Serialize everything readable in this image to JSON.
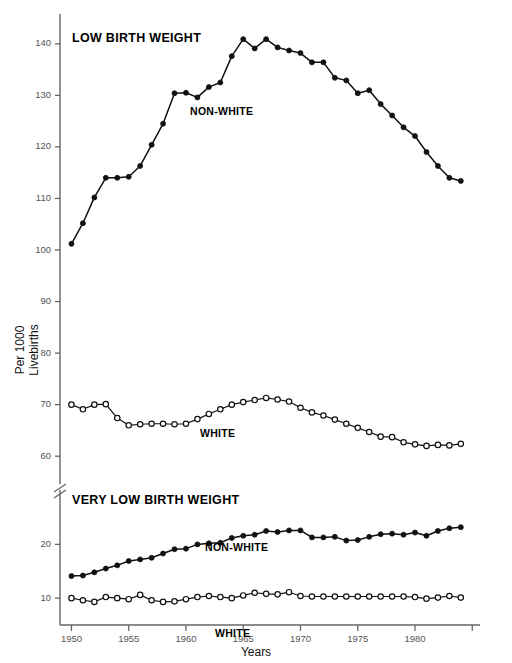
{
  "figure": {
    "background": "#ffffff",
    "line_color": "#111111",
    "axis_color": "#666666"
  },
  "axes": {
    "xlabel": "Years",
    "ylabel_line1": "Per 1000",
    "ylabel_line2": "Livebirths",
    "x_ticks": [
      1950,
      1955,
      1960,
      1965,
      1970,
      1975,
      1980,
      1985
    ],
    "x_tick_labels": [
      "1950",
      "1955",
      "1960",
      "1965",
      "1970",
      "1975",
      "1980",
      ""
    ],
    "xlim": [
      1949,
      1985.5
    ],
    "upper_y_ticks": [
      60,
      70,
      80,
      90,
      100,
      110,
      120,
      130,
      140
    ],
    "upper_ylim": [
      55,
      145
    ],
    "lower_y_ticks": [
      10,
      20
    ],
    "lower_ylim": [
      5,
      29
    ],
    "axis_break": true,
    "grid": false
  },
  "panels": {
    "upper": {
      "title": "LOW BIRTH WEIGHT"
    },
    "lower": {
      "title": "VERY LOW BIRTH WEIGHT"
    }
  },
  "labels": {
    "upper_nonwhite": "NON-WHITE",
    "upper_white": "WHITE",
    "lower_nonwhite": "NON-WHITE",
    "lower_white": "WHITE"
  },
  "chart_data": {
    "type": "line",
    "xlabel": "Years",
    "ylabel": "Per 1000 Livebirths",
    "legend_position": "inline-annotation",
    "grid": false,
    "x": [
      1950,
      1951,
      1952,
      1953,
      1954,
      1955,
      1956,
      1957,
      1958,
      1959,
      1960,
      1961,
      1962,
      1963,
      1964,
      1965,
      1966,
      1967,
      1968,
      1969,
      1970,
      1971,
      1972,
      1973,
      1974,
      1975,
      1976,
      1977,
      1978,
      1979,
      1980,
      1981,
      1982,
      1983,
      1984
    ],
    "panels": [
      {
        "name": "Low Birth Weight",
        "ylim": [
          55,
          145
        ],
        "yticks": [
          60,
          70,
          80,
          90,
          100,
          110,
          120,
          130,
          140
        ],
        "series": [
          {
            "name": "NON-WHITE",
            "marker": "filled-circle",
            "values": [
              101.2,
              105.2,
              110.2,
              114.0,
              114.0,
              114.2,
              116.3,
              120.4,
              124.5,
              130.4,
              130.5,
              129.6,
              131.6,
              132.5,
              137.6,
              140.9,
              139.1,
              140.9,
              139.3,
              138.7,
              138.2,
              136.4,
              136.4,
              133.4,
              132.9,
              130.4,
              131.0,
              128.3,
              126.1,
              123.8,
              122.1,
              119.0,
              116.3,
              114.0,
              113.4
            ]
          },
          {
            "name": "WHITE",
            "marker": "open-circle",
            "values": [
              70.0,
              69.1,
              70.0,
              70.1,
              67.4,
              66.0,
              66.2,
              66.3,
              66.3,
              66.2,
              66.3,
              67.2,
              68.2,
              69.1,
              70.0,
              70.5,
              70.9,
              71.3,
              71.0,
              70.6,
              69.4,
              68.5,
              67.9,
              67.1,
              66.3,
              65.5,
              64.7,
              63.8,
              63.7,
              62.7,
              62.3,
              62.0,
              62.2,
              62.1,
              62.4
            ]
          }
        ]
      },
      {
        "name": "Very Low Birth Weight",
        "ylim": [
          5,
          29
        ],
        "yticks": [
          10,
          20
        ],
        "series": [
          {
            "name": "NON-WHITE",
            "marker": "filled-circle",
            "values": [
              14.1,
              14.2,
              14.8,
              15.5,
              16.1,
              16.9,
              17.2,
              17.5,
              18.3,
              19.1,
              19.2,
              20.0,
              20.2,
              20.3,
              21.2,
              21.6,
              21.8,
              22.5,
              22.3,
              22.6,
              22.6,
              21.3,
              21.3,
              21.4,
              20.7,
              20.8,
              21.4,
              21.9,
              22.0,
              21.8,
              22.2,
              21.6,
              22.5,
              23.0,
              23.2
            ]
          },
          {
            "name": "WHITE",
            "marker": "open-circle",
            "values": [
              10.0,
              9.6,
              9.3,
              10.2,
              10.0,
              9.8,
              10.6,
              9.6,
              9.3,
              9.4,
              9.8,
              10.2,
              10.4,
              10.2,
              10.0,
              10.5,
              11.0,
              10.8,
              10.7,
              11.1,
              10.4,
              10.3,
              10.3,
              10.3,
              10.3,
              10.3,
              10.3,
              10.3,
              10.3,
              10.3,
              10.2,
              9.9,
              10.1,
              10.4,
              10.1
            ]
          }
        ]
      }
    ]
  }
}
